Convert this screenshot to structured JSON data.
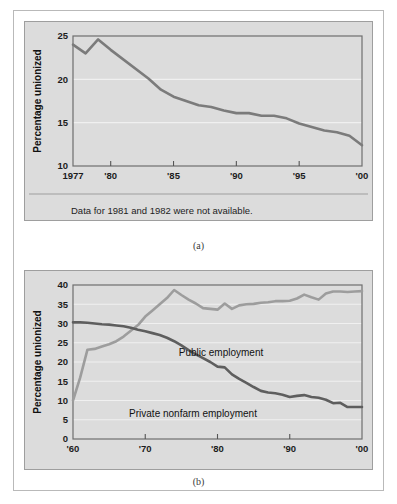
{
  "figure": {
    "caption_a": "(a)",
    "caption_b": "(b)",
    "note_a": "Data for 1981 and 1982 were not available.",
    "panel_bg": "#dcdcdc",
    "frame_color": "#9e9e9e",
    "gridline_color": "#f0f0f0"
  },
  "chart_data": [
    {
      "id": "chart-a",
      "type": "line",
      "title": "",
      "xlabel": "",
      "ylabel": "Percentage unionized",
      "xlim": [
        1977,
        2000
      ],
      "ylim": [
        10,
        25
      ],
      "grid": true,
      "legend": "none",
      "note": "Data for 1981 and 1982 were not available.",
      "xtick_values": [
        1977,
        1980,
        1985,
        1990,
        1995,
        2000
      ],
      "xtick_labels": [
        "1977",
        "'80",
        "'85",
        "'90",
        "'95",
        "'00"
      ],
      "ytick_values": [
        10,
        15,
        20,
        25
      ],
      "ytick_labels": [
        "10",
        "15",
        "20",
        "25"
      ],
      "series": [
        {
          "name": "Percentage unionized",
          "color": "#7b7b7b",
          "x": [
            1977,
            1978,
            1979,
            1980,
            1983,
            1984,
            1985,
            1986,
            1987,
            1988,
            1989,
            1990,
            1991,
            1992,
            1993,
            1994,
            1995,
            1996,
            1997,
            1998,
            1999,
            2000
          ],
          "y": [
            24.0,
            23.0,
            24.6,
            23.4,
            20.1,
            18.8,
            18.0,
            17.5,
            17.0,
            16.8,
            16.4,
            16.1,
            16.1,
            15.8,
            15.8,
            15.5,
            14.9,
            14.5,
            14.1,
            13.9,
            13.5,
            12.4
          ]
        }
      ]
    },
    {
      "id": "chart-b",
      "type": "line",
      "title": "",
      "xlabel": "",
      "ylabel": "Percentage unionized",
      "xlim": [
        1960,
        2000
      ],
      "ylim": [
        0,
        40
      ],
      "grid": true,
      "legend": "inline-annotations",
      "xtick_values": [
        1960,
        1970,
        1980,
        1990,
        2000
      ],
      "xtick_labels": [
        "'60",
        "'70",
        "'80",
        "'90",
        "'00"
      ],
      "ytick_values": [
        0,
        5,
        10,
        15,
        20,
        25,
        30,
        35,
        40
      ],
      "ytick_labels": [
        "0",
        "5",
        "10",
        "15",
        "20",
        "25",
        "30",
        "35",
        "40"
      ],
      "series": [
        {
          "name": "Public employment",
          "label": "Public employment",
          "color": "#9d9d9d",
          "x": [
            1960,
            1961,
            1962,
            1963,
            1964,
            1965,
            1966,
            1967,
            1968,
            1969,
            1970,
            1971,
            1972,
            1973,
            1974,
            1975,
            1976,
            1977,
            1978,
            1979,
            1980,
            1981,
            1982,
            1983,
            1984,
            1985,
            1986,
            1987,
            1988,
            1989,
            1990,
            1991,
            1992,
            1993,
            1994,
            1995,
            1996,
            1997,
            1998,
            1999,
            2000
          ],
          "y": [
            10.0,
            16.0,
            23.2,
            23.4,
            24.0,
            24.6,
            25.4,
            26.6,
            28.1,
            29.6,
            31.8,
            33.4,
            35.0,
            36.6,
            38.7,
            37.4,
            36.2,
            35.2,
            34.0,
            33.8,
            33.6,
            35.2,
            33.8,
            34.7,
            35.0,
            35.1,
            35.4,
            35.5,
            35.8,
            35.8,
            35.9,
            36.5,
            37.5,
            36.8,
            36.2,
            37.8,
            38.3,
            38.3,
            38.2,
            38.3,
            38.4
          ]
        },
        {
          "name": "Private nonfarm employment",
          "label": "Private nonfarm employment",
          "color": "#5e5e5e",
          "x": [
            1960,
            1961,
            1962,
            1963,
            1964,
            1965,
            1966,
            1967,
            1968,
            1969,
            1970,
            1971,
            1972,
            1973,
            1974,
            1975,
            1976,
            1977,
            1978,
            1979,
            1980,
            1981,
            1982,
            1983,
            1984,
            1985,
            1986,
            1987,
            1988,
            1989,
            1990,
            1991,
            1992,
            1993,
            1994,
            1995,
            1996,
            1997,
            1998,
            1999,
            2000
          ],
          "y": [
            30.3,
            30.3,
            30.2,
            30.0,
            29.8,
            29.7,
            29.5,
            29.3,
            28.9,
            28.4,
            28.0,
            27.5,
            27.0,
            26.3,
            25.4,
            24.3,
            23.1,
            22.0,
            21.0,
            20.0,
            18.8,
            18.6,
            16.8,
            15.6,
            14.6,
            13.5,
            12.5,
            12.1,
            11.9,
            11.5,
            10.9,
            11.2,
            11.4,
            10.9,
            10.7,
            10.2,
            9.3,
            9.4,
            8.3,
            8.3,
            8.3
          ]
        }
      ]
    }
  ]
}
